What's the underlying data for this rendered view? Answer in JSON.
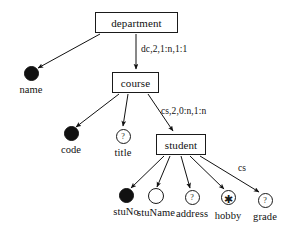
{
  "diagram": {
    "ink_color": "#111111",
    "background_color": "#ffffff",
    "entities": [
      {
        "id": "department",
        "label": "department",
        "x": 95,
        "y": 12,
        "w": 83,
        "h": 21
      },
      {
        "id": "course",
        "label": "course",
        "x": 112,
        "y": 72,
        "w": 47,
        "h": 21
      },
      {
        "id": "student",
        "label": "student",
        "x": 156,
        "y": 134,
        "w": 50,
        "h": 21
      }
    ],
    "attributes": [
      {
        "id": "name",
        "label": "name",
        "cx": 31,
        "cy": 73,
        "r": 7.5,
        "kind": "filled",
        "glyph": "",
        "label_x": 31,
        "label_y": 84
      },
      {
        "id": "code",
        "label": "code",
        "cx": 71,
        "cy": 133,
        "r": 7.5,
        "kind": "filled",
        "glyph": "",
        "label_x": 71,
        "label_y": 144
      },
      {
        "id": "title",
        "label": "title",
        "cx": 123,
        "cy": 136,
        "r": 7.5,
        "kind": "open",
        "glyph": "?",
        "label_x": 123,
        "label_y": 147
      },
      {
        "id": "stuNo",
        "label": "stuNo",
        "cx": 126,
        "cy": 195,
        "r": 7.5,
        "kind": "filled",
        "glyph": "",
        "label_x": 126,
        "label_y": 206
      },
      {
        "id": "stuName",
        "label": "stuName",
        "cx": 156,
        "cy": 196,
        "r": 8.0,
        "kind": "open",
        "glyph": "",
        "label_x": 156,
        "label_y": 207
      },
      {
        "id": "address",
        "label": "address",
        "cx": 192,
        "cy": 197,
        "r": 7.5,
        "kind": "open",
        "glyph": "?",
        "label_x": 192,
        "label_y": 208
      },
      {
        "id": "hobby",
        "label": "hobby",
        "cx": 228,
        "cy": 197,
        "r": 7.5,
        "kind": "open",
        "glyph": "✱",
        "label_x": 228,
        "label_y": 210
      },
      {
        "id": "grade",
        "label": "grade",
        "cx": 265,
        "cy": 200,
        "r": 7.5,
        "kind": "open",
        "glyph": "?",
        "label_x": 265,
        "label_y": 211
      }
    ],
    "edges": [
      {
        "id": "department-name",
        "from": "department",
        "to": "name",
        "x1": 100,
        "y1": 34,
        "x2": 38,
        "y2": 68
      },
      {
        "id": "department-course",
        "from": "department",
        "to": "course",
        "x1": 136,
        "y1": 34,
        "x2": 136,
        "y2": 69
      },
      {
        "id": "course-code",
        "from": "course",
        "to": "code",
        "x1": 119,
        "y1": 94,
        "x2": 76,
        "y2": 127
      },
      {
        "id": "course-title",
        "from": "course",
        "to": "title",
        "x1": 128,
        "y1": 94,
        "x2": 123,
        "y2": 126
      },
      {
        "id": "course-student",
        "from": "course",
        "to": "student",
        "x1": 148,
        "y1": 94,
        "x2": 173,
        "y2": 131
      },
      {
        "id": "student-stuNo",
        "from": "student",
        "to": "stuNo",
        "x1": 164,
        "y1": 156,
        "x2": 131,
        "y2": 188
      },
      {
        "id": "student-stuName",
        "from": "student",
        "to": "stuName",
        "x1": 170,
        "y1": 156,
        "x2": 157,
        "y2": 187
      },
      {
        "id": "student-address",
        "from": "student",
        "to": "address",
        "x1": 181,
        "y1": 156,
        "x2": 190,
        "y2": 188
      },
      {
        "id": "student-hobby",
        "from": "student",
        "to": "hobby",
        "x1": 190,
        "y1": 156,
        "x2": 224,
        "y2": 189
      },
      {
        "id": "student-grade",
        "from": "student",
        "to": "grade",
        "x1": 200,
        "y1": 156,
        "x2": 259,
        "y2": 192
      }
    ],
    "edge_labels": [
      {
        "id": "dept-course-label",
        "text": "dc,2,1:n,1:1",
        "x": 141,
        "y": 44
      },
      {
        "id": "course-student-label",
        "text": "cs,2,0:n,1:n",
        "x": 161,
        "y": 106
      },
      {
        "id": "student-grade-label",
        "text": "cs",
        "x": 238,
        "y": 163
      }
    ]
  }
}
